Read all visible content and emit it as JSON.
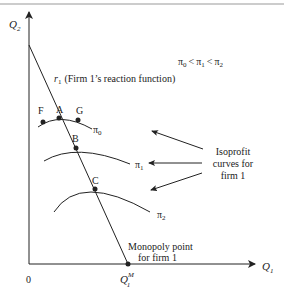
{
  "diagram": {
    "axes": {
      "y_label": "Q",
      "y_label_sub": "2",
      "x_label": "Q",
      "x_label_sub": "1",
      "origin_label": "0"
    },
    "reaction_function": {
      "symbol": "r",
      "symbol_sub": "1",
      "label": "(Firm 1’s reaction function)"
    },
    "inequality": {
      "pi0": "π",
      "sub0": "0",
      "lt1": "<",
      "pi1": "π",
      "sub1": "1",
      "lt2": "<",
      "pi2": "π",
      "sub2": "2"
    },
    "points": {
      "F": "F",
      "A": "A",
      "G": "G",
      "B": "B",
      "C": "C"
    },
    "curves": [
      {
        "name": "π",
        "sub": "0"
      },
      {
        "name": "π",
        "sub": "1"
      },
      {
        "name": "π",
        "sub": "2"
      }
    ],
    "annotation": {
      "line1": "Isoprofit",
      "line2": "curves for",
      "line3": "firm 1"
    },
    "monopoly": {
      "line1": "Monopoly point",
      "line2": "for firm 1",
      "tick_label": "Q",
      "tick_sub": "1",
      "tick_sup": "M"
    },
    "colors": {
      "line": "#222222",
      "border": "#888888"
    }
  }
}
